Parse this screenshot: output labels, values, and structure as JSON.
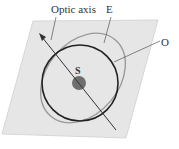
{
  "diagram": {
    "labels": {
      "optic_axis": "Optic axis",
      "extraordinary": "E",
      "ordinary": "O",
      "source": "S"
    },
    "colors": {
      "plane_fill": "#e6e6e6",
      "plane_stroke": "#cfcfcf",
      "ordinary_circle": "#222222",
      "extraordinary_ellipse": "#9a9a9a",
      "source_dot": "#6e6e6e",
      "axis_line": "#333333",
      "text": "#333333"
    }
  }
}
